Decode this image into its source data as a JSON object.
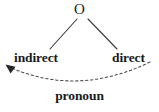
{
  "diagram": {
    "type": "tree-with-dashed-arc",
    "background_color": "#ffffff",
    "line_color": "#3a3a3a",
    "text_color": "#1a1a1a",
    "nodes": [
      {
        "id": "o",
        "label": "O",
        "role": "root-object-node"
      },
      {
        "id": "indirect",
        "label": "indirect",
        "role": "left-branch-leaf"
      },
      {
        "id": "direct",
        "label": "direct",
        "role": "right-branch-leaf"
      }
    ],
    "edges": [
      {
        "id": "left-branch",
        "from": "o",
        "to": "indirect",
        "style": "solid"
      },
      {
        "id": "right-branch",
        "from": "o",
        "to": "direct",
        "style": "solid"
      },
      {
        "id": "pronoun-arc",
        "from": "direct",
        "to": "indirect",
        "style": "dashed",
        "arrow": "left",
        "label": "pronoun"
      }
    ],
    "arc_label": "pronoun"
  }
}
